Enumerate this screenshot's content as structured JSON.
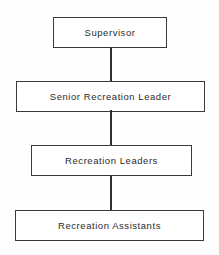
{
  "chart": {
    "type": "org-chart",
    "orientation": "vertical",
    "background_color": "#fefefe",
    "border_color": "#3a3a3a",
    "text_color": "#2b2b2b",
    "connector_color": "#2f2f2f",
    "levels": [
      {
        "rank": 1,
        "label": "Supervisor",
        "x": 53,
        "y": 17,
        "width": 114,
        "height": 31
      },
      {
        "rank": 2,
        "label": "Senior Recreation Leader",
        "x": 16,
        "y": 81,
        "width": 189,
        "height": 31
      },
      {
        "rank": 3,
        "label": "Recreation Leaders",
        "x": 31,
        "y": 145,
        "width": 161,
        "height": 31
      },
      {
        "rank": 4,
        "label": "Recreation Assistants",
        "x": 15,
        "y": 210,
        "width": 189,
        "height": 31
      }
    ],
    "connectors": [
      {
        "from": "Supervisor",
        "to": "Senior Recreation Leader"
      },
      {
        "from": "Senior Recreation Leader",
        "to": "Recreation Leaders"
      },
      {
        "from": "Recreation Leaders",
        "to": "Recreation Assistants"
      }
    ]
  }
}
